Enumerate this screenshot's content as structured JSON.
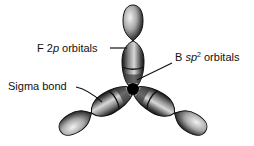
{
  "diagram": {
    "labels": {
      "f2p": {
        "prefix": "F 2",
        "italic": "p",
        "suffix": " orbitals"
      },
      "bsp2": {
        "prefix": "B ",
        "italic": "sp",
        "sup": "2",
        "suffix": " orbitals"
      },
      "sigma": {
        "text": "Sigma bond"
      }
    },
    "colors": {
      "lobe_dark": "#1a1a1a",
      "lobe_mid": "#6e6e6e",
      "lobe_light": "#e8e8e8",
      "center": "#000000",
      "leader": "#111111"
    }
  }
}
